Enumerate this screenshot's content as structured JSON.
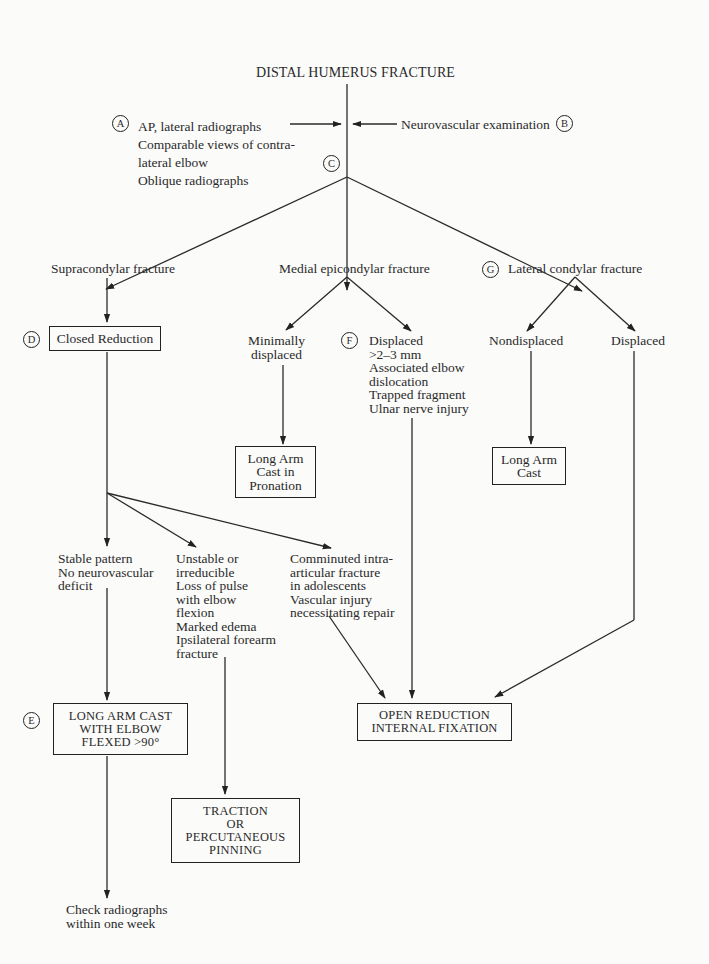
{
  "title": "DISTAL HUMERUS FRACTURE",
  "markers": {
    "A": "A",
    "B": "B",
    "C": "C",
    "D": "D",
    "E": "E",
    "F": "F",
    "G": "G"
  },
  "workup": {
    "imaging": "AP, lateral radiographs\nComparable views of contra-\nlateral elbow\nOblique radiographs",
    "exam": "Neurovascular examination"
  },
  "fracture_types": {
    "supracondylar": "Supracondylar fracture",
    "medial_epicondylar": "Medial epicondylar fracture",
    "lateral_condylar": "Lateral condylar fracture"
  },
  "supracondylar": {
    "closed_reduction": "Closed Reduction",
    "stable": "Stable pattern\nNo neurovascular\ndeficit",
    "unstable": "Unstable or\nirreducible\nLoss of pulse\nwith elbow\nflexion\nMarked edema\nIpsilateral forearm\nfracture",
    "comminuted": "Comminuted intra-\narticular fracture\nin adolescents\nVascular injury\nnecessitating repair",
    "long_arm_cast_flexed": "LONG ARM CAST\nWITH ELBOW\nFLEXED >90°",
    "traction": "TRACTION\nOR\nPERCUTANEOUS\nPINNING",
    "followup": "Check radiographs\nwithin one week"
  },
  "medial": {
    "minimal": "Minimally\ndisplaced",
    "displaced": "Displaced\n>2–3 mm\nAssociated elbow\ndislocation\nTrapped fragment\nUlnar nerve injury",
    "cast_pronation": "Long Arm\nCast in\nPronation"
  },
  "lateral": {
    "nondisplaced": "Nondisplaced",
    "displaced": "Displaced",
    "cast": "Long Arm\nCast"
  },
  "orif": "OPEN REDUCTION\nINTERNAL FIXATION"
}
